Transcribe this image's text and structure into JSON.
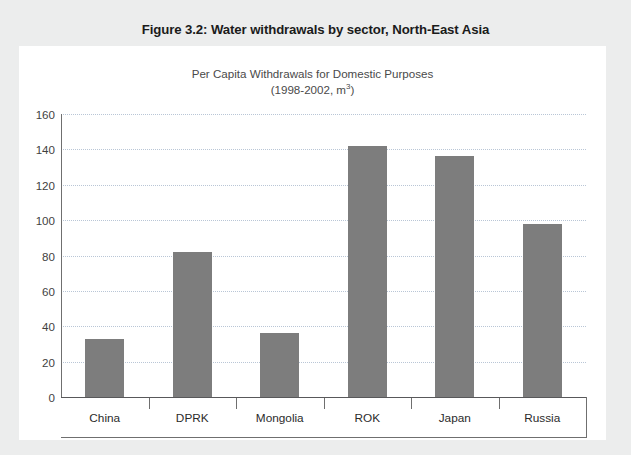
{
  "figure": {
    "title": "Figure 3.2: Water withdrawals by sector, North-East Asia"
  },
  "chart_data": {
    "type": "bar",
    "title": "Per Capita Withdrawals for Domestic Purposes",
    "subtitle": "(1998-2002, m3)",
    "subtitle_line1": "Per Capita Withdrawals for Domestic Purposes",
    "subtitle_line2_prefix": "(1998-2002, m",
    "subtitle_line2_sup": "3",
    "subtitle_line2_suffix": ")",
    "xlabel": "",
    "ylabel": "",
    "categories": [
      "China",
      "DPRK",
      "Mongolia",
      "ROK",
      "Japan",
      "Russia"
    ],
    "values": [
      33,
      82,
      36,
      142,
      136,
      98
    ],
    "ylim": [
      0,
      160
    ],
    "ytick_step": 20,
    "yticks": [
      0,
      20,
      40,
      60,
      80,
      100,
      120,
      140,
      160
    ],
    "ytick_labels": [
      "0",
      "20",
      "40",
      "60",
      "80",
      "100",
      "120",
      "140",
      "160"
    ],
    "grid": true,
    "legend": false,
    "legend_position": "none",
    "bar_color": "#7d7d7d",
    "gridline_color": "#b9c6d6",
    "axis_color": "#6f6f6f",
    "panel_background": "#ffffff",
    "page_background": "#eceded"
  }
}
